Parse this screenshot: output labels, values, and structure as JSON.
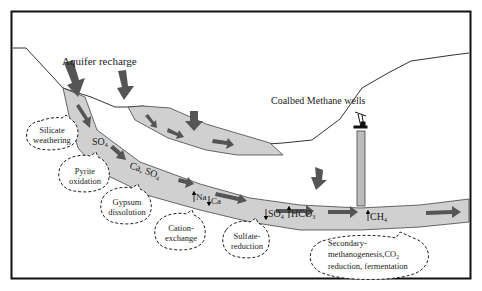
{
  "title_labels": {
    "aquifer_recharge": "Aquifer recharge",
    "cbm_wells": "Coalbed Methane wells"
  },
  "species": {
    "so4_1": "SO",
    "so4_1_sub": "4",
    "ca_so4": "Ca, SO",
    "ca_so4_sub": "4",
    "na": "Na",
    "ca": "Ca",
    "so4_2": "SO",
    "so4_2_sub": "4",
    "hco3": "HCO",
    "hco3_sub": "3",
    "ch4": "CH",
    "ch4_sub": "4"
  },
  "processes": [
    {
      "line1": "Silicate",
      "line2": "weathering"
    },
    {
      "line1": "Pyrite",
      "line2": "oxidation"
    },
    {
      "line1": "Gypsum",
      "line2": "dissolution"
    },
    {
      "line1": "Cation-",
      "line2": "exchange"
    },
    {
      "line1": "Sulfate-",
      "line2": "reduction"
    },
    {
      "line1": "Secondary-",
      "line2": "methanogenesis,CO",
      "line2_sub": "2",
      "line3": "reduction, fermentation"
    }
  ],
  "colors": {
    "aquifer_fill": "#d0d0d0",
    "arrow": "#5a5a5a",
    "frame": "#111111",
    "ground_line": "#333333",
    "bubble_stroke": "#222222"
  }
}
